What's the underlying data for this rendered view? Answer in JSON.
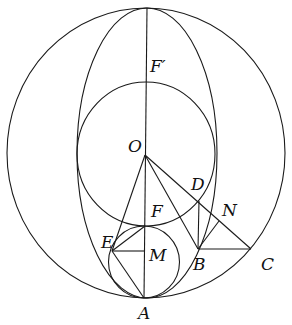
{
  "figure": {
    "type": "geometric-diagram",
    "width": 292,
    "height": 325,
    "stroke_color": "#1a1a1a",
    "label_color": "#111111",
    "points": {
      "O": {
        "x": 145,
        "y": 154,
        "label": "O",
        "lx": 128,
        "ly": 152
      },
      "F_prime": {
        "x": 146,
        "y": 80,
        "label": "F′",
        "lx": 150,
        "ly": 72
      },
      "F": {
        "x": 145,
        "y": 226,
        "label": "F",
        "lx": 151,
        "ly": 217
      },
      "D": {
        "x": 199,
        "y": 201,
        "label": "D",
        "lx": 191,
        "ly": 190
      },
      "N": {
        "x": 219,
        "y": 221,
        "label": "N",
        "lx": 222,
        "ly": 216
      },
      "E": {
        "x": 112,
        "y": 251,
        "label": "E",
        "lx": 101,
        "ly": 248
      },
      "M": {
        "x": 144,
        "y": 251,
        "label": "M",
        "lx": 149,
        "ly": 261
      },
      "B": {
        "x": 198,
        "y": 249,
        "label": "B",
        "lx": 193,
        "ly": 270
      },
      "C": {
        "x": 251,
        "y": 249,
        "label": "C",
        "lx": 261,
        "ly": 270
      },
      "A": {
        "x": 144,
        "y": 298,
        "label": "A",
        "lx": 138,
        "ly": 319
      }
    },
    "curves": [
      {
        "name": "outer-circle",
        "cx": 146,
        "cy": 153,
        "rx": 139,
        "ry": 145
      },
      {
        "name": "ellipse",
        "cx": 147,
        "cy": 153,
        "rx": 70,
        "ry": 145
      },
      {
        "name": "middle-circle",
        "cx": 146,
        "cy": 154,
        "rx": 69,
        "ry": 72
      },
      {
        "name": "small-circle",
        "cx": 144,
        "cy": 262,
        "rx": 35.5,
        "ry": 36
      }
    ],
    "segments": [
      {
        "name": "axis-vertical",
        "from": [
          147,
          8
        ],
        "to": [
          144,
          298
        ]
      },
      {
        "name": "segment-OE",
        "from": [
          145,
          155
        ],
        "to": [
          112,
          251
        ]
      },
      {
        "name": "segment-OB",
        "from": [
          145,
          155
        ],
        "to": [
          198,
          249
        ]
      },
      {
        "name": "segment-OC",
        "from": [
          145,
          155
        ],
        "to": [
          251,
          249
        ]
      },
      {
        "name": "segment-DB",
        "from": [
          199,
          201
        ],
        "to": [
          198,
          249
        ]
      },
      {
        "name": "segment-BC",
        "from": [
          198,
          249
        ],
        "to": [
          251,
          249
        ]
      },
      {
        "name": "segment-BN",
        "from": [
          198,
          249
        ],
        "to": [
          219,
          221
        ]
      },
      {
        "name": "segment-EM",
        "from": [
          112,
          251
        ],
        "to": [
          144,
          251
        ]
      },
      {
        "name": "segment-EF",
        "from": [
          112,
          251
        ],
        "to": [
          145,
          226
        ]
      },
      {
        "name": "segment-EA",
        "from": [
          112,
          251
        ],
        "to": [
          144,
          298
        ]
      }
    ]
  }
}
